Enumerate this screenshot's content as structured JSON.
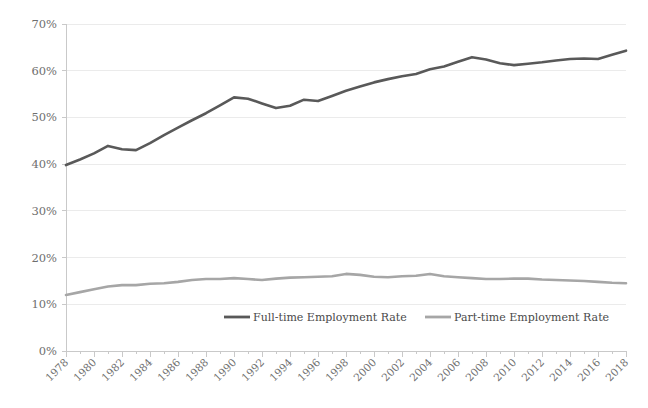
{
  "chart_data": {
    "type": "line",
    "title": "",
    "subtitle": "",
    "xlabel": "",
    "ylabel": "",
    "xlim": [
      1978,
      2018
    ],
    "ylim": [
      0,
      70
    ],
    "grid": true,
    "legend_position": "bottom",
    "y_tick_labels": [
      "70%",
      "60%",
      "50%",
      "40%",
      "30%",
      "20%",
      "10%",
      "0%"
    ],
    "y_tick_values": [
      70,
      60,
      50,
      40,
      30,
      20,
      10,
      0
    ],
    "x_tick_labels": [
      "1978",
      "1980",
      "1982",
      "1984",
      "1986",
      "1988",
      "1990",
      "1992",
      "1994",
      "1996",
      "1998",
      "2000",
      "2002",
      "2004",
      "2006",
      "2008",
      "2010",
      "2012",
      "2014",
      "2016",
      "2018"
    ],
    "x": [
      1978,
      1979,
      1980,
      1981,
      1982,
      1983,
      1984,
      1985,
      1986,
      1987,
      1988,
      1989,
      1990,
      1991,
      1992,
      1993,
      1994,
      1995,
      1996,
      1997,
      1998,
      1999,
      2000,
      2001,
      2002,
      2003,
      2004,
      2005,
      2006,
      2007,
      2008,
      2009,
      2010,
      2011,
      2012,
      2013,
      2014,
      2015,
      2016,
      2017,
      2018
    ],
    "series": [
      {
        "name": "Full-time Employment Rate",
        "color": "#595959",
        "values": [
          39.8,
          41.0,
          42.3,
          43.9,
          43.2,
          43.0,
          44.5,
          46.2,
          47.8,
          49.4,
          50.9,
          52.6,
          54.3,
          54.0,
          53.0,
          52.0,
          52.5,
          53.8,
          53.5,
          54.6,
          55.7,
          56.6,
          57.5,
          58.2,
          58.8,
          59.3,
          60.3,
          60.9,
          61.9,
          62.9,
          62.4,
          61.6,
          61.2,
          61.5,
          61.8,
          62.2,
          62.5,
          62.6,
          62.5,
          63.4,
          64.3
        ]
      },
      {
        "name": "Part-time Employment Rate",
        "color": "#a6a6a6",
        "values": [
          12.0,
          12.6,
          13.2,
          13.8,
          14.1,
          14.1,
          14.4,
          14.5,
          14.8,
          15.2,
          15.4,
          15.4,
          15.6,
          15.4,
          15.2,
          15.5,
          15.7,
          15.8,
          15.9,
          16.0,
          16.5,
          16.3,
          15.9,
          15.8,
          16.0,
          16.1,
          16.5,
          16.0,
          15.8,
          15.6,
          15.4,
          15.4,
          15.5,
          15.5,
          15.3,
          15.2,
          15.1,
          15.0,
          14.8,
          14.6,
          14.5
        ]
      }
    ]
  },
  "legend": {
    "items": [
      {
        "label": "Full-time Employment Rate",
        "color": "#595959"
      },
      {
        "label": "Part-time Employment Rate",
        "color": "#a6a6a6"
      }
    ]
  }
}
